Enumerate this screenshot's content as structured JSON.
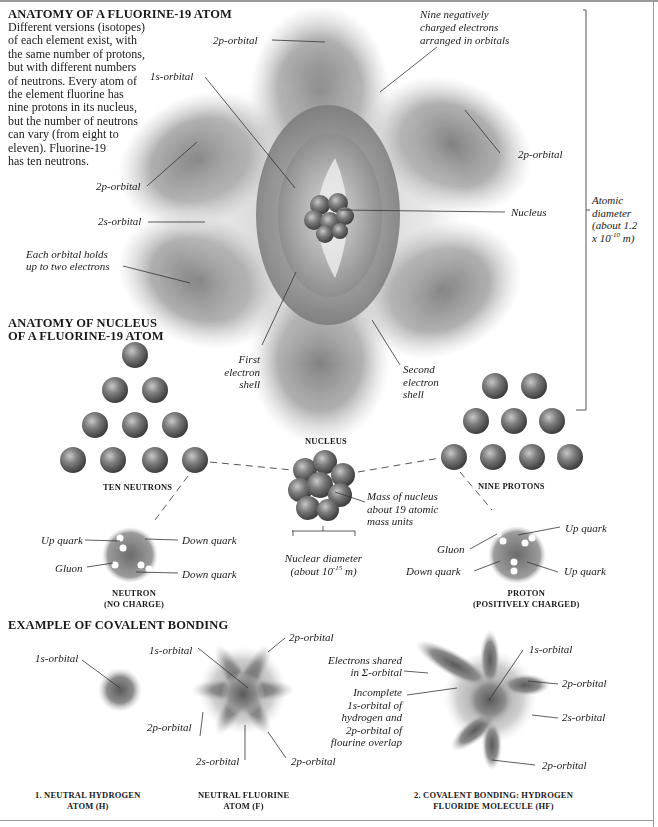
{
  "section_atom": {
    "title": "ANATOMY OF A FLUORINE-19 ATOM",
    "description": "Different versions (isotopes) of each element exist, with the same number of protons, but with different numbers of neutrons. Every atom of the element fluorine has nine protons in its nucleus, but the number of neutrons can vary (from eight to eleven). Fluorine-19 has ten neutrons.",
    "description_lines": [
      "Different versions (isotopes)",
      "of each element exist, with",
      "the same number of protons,",
      "but with different numbers",
      "of neutrons. Every atom of",
      "the element fluorine has",
      "nine protons in its nucleus,",
      "but the number of neutrons",
      "can vary (from eight to",
      "eleven). Fluorine-19",
      "has ten neutrons."
    ],
    "labels": {
      "p2_top": "2p-orbital",
      "s1": "1s-orbital",
      "electrons_1": "Nine negatively",
      "electrons_2": "charged electrons",
      "electrons_3": "arranged in orbitals",
      "p2_right": "2p-orbital",
      "p2_left": "2p-orbital",
      "s2": "2s-orbital",
      "nucleus": "Nucleus",
      "each_orbital_1": "Each orbital holds",
      "each_orbital_2": "up to two electrons",
      "first_shell_1": "First",
      "first_shell_2": "electron",
      "first_shell_3": "shell",
      "second_shell_1": "Second",
      "second_shell_2": "electron",
      "second_shell_3": "shell",
      "diameter_1": "Atomic",
      "diameter_2": "diameter",
      "diameter_3": "(about 1.2",
      "diameter_4_base": "x 10",
      "diameter_4_exp": "-10",
      "diameter_4_unit": " m)"
    }
  },
  "section_nucleus": {
    "title_1": "ANATOMY OF NUCLEUS",
    "title_2": "OF A FLUORINE-19 ATOM",
    "neutrons_caption": "TEN NEUTRONS",
    "neutron_count": 10,
    "protons_caption": "NINE PROTONS",
    "proton_count": 9,
    "nucleus_caption": "NUCLEUS",
    "mass_1": "Mass of nucleus",
    "mass_2": "about 19 atomic",
    "mass_3": "mass units",
    "nuclear_diameter_1": "Nuclear diameter",
    "nuclear_diameter_2_base": "(about 10",
    "nuclear_diameter_2_exp": "-15",
    "nuclear_diameter_2_unit": " m)",
    "neutron": {
      "up_quark": "Up quark",
      "down_quark_1": "Down quark",
      "gluon": "Gluon",
      "down_quark_2": "Down quark",
      "caption_1": "NEUTRON",
      "caption_2": "(NO CHARGE)"
    },
    "proton": {
      "up_quark_1": "Up quark",
      "gluon": "Gluon",
      "down_quark": "Down quark",
      "up_quark_2": "Up quark",
      "caption_1": "PROTON",
      "caption_2": "(POSITIVELY CHARGED)"
    }
  },
  "section_bonding": {
    "title": "EXAMPLE OF COVALENT BONDING",
    "hydrogen": {
      "s1": "1s-orbital",
      "caption_1": "1. NEUTRAL HYDROGEN",
      "caption_2": "ATOM (H)"
    },
    "fluorine": {
      "s1": "1s-orbital",
      "p2_top": "2p-orbital",
      "p2_left": "2p-orbital",
      "s2": "2s-orbital",
      "p2_bottom": "2p-orbital",
      "caption_1": "NEUTRAL FLUORINE",
      "caption_2": "ATOM (F)"
    },
    "hf": {
      "shared_1": "Electrons shared",
      "shared_2": "in Σ-orbital",
      "incomplete_1": "Incomplete",
      "incomplete_2": "1s-orbital of",
      "incomplete_3": "hydrogen and",
      "incomplete_4": "2p-orbital of",
      "incomplete_5": "flourine overlap",
      "s1": "1s-orbital",
      "p2_right": "2p-orbital",
      "s2": "2s-orbital",
      "p2_bottom": "2p-orbital",
      "caption_1": "2. COVALENT BONDING: HYDROGEN",
      "caption_2": "FLUORIDE MOLECULE (HF)"
    }
  },
  "colors": {
    "text": "#1a1a1a",
    "orbital_dark": "#555555",
    "orbital_light": "#d8d8d8",
    "particle": "#6e6e6e",
    "frame": "#9a9a9a"
  }
}
